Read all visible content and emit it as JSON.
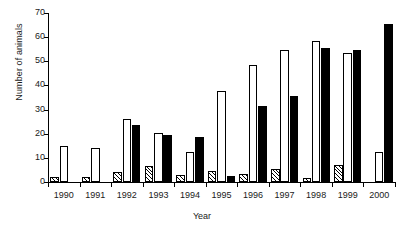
{
  "chart_data": {
    "type": "bar",
    "title": "",
    "xlabel": "Year",
    "ylabel": "Number of animals",
    "categories": [
      "1990",
      "1991",
      "1992",
      "1993",
      "1994",
      "1995",
      "1996",
      "1997",
      "1998",
      "1999",
      "2000"
    ],
    "ylim": [
      0,
      70
    ],
    "yticks": [
      0,
      10,
      20,
      30,
      40,
      50,
      60,
      70
    ],
    "grid": false,
    "legend": "none",
    "series": [
      {
        "name": "hatched",
        "fill": "diagonal-hatch",
        "values": [
          2,
          2,
          4,
          6.5,
          3,
          4.5,
          3.5,
          5.5,
          1.5,
          7,
          0
        ]
      },
      {
        "name": "white",
        "fill": "white",
        "values": [
          15,
          14,
          26,
          20.5,
          12.5,
          37.5,
          48.5,
          54.5,
          58.5,
          53.5,
          12.5
        ]
      },
      {
        "name": "black",
        "fill": "black",
        "values": [
          0,
          0,
          23.5,
          19.5,
          18.5,
          2.5,
          31.5,
          35.5,
          55.5,
          54.5,
          65.5
        ]
      }
    ],
    "colors": {
      "axis": "#000000",
      "text": "#1a1a1a",
      "bar_white": "#ffffff",
      "bar_black": "#000000",
      "bar_hatch": "#000000",
      "background": "#ffffff"
    }
  },
  "axes": {
    "y_title": "Number of animals",
    "x_title": "Year"
  }
}
